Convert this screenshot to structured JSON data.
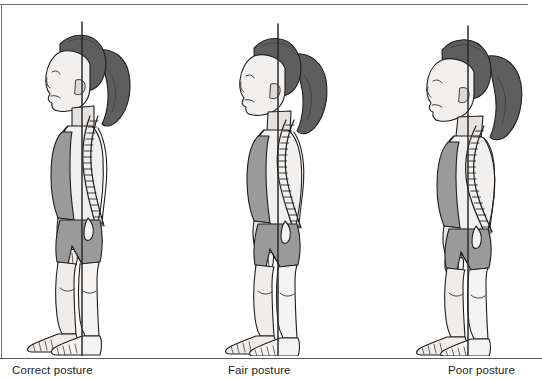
{
  "illustration": {
    "title": "Posture comparison chart",
    "subject": "young girl standing in right-side profile view",
    "view": "lateral (sagittal) profile, facing left",
    "count": 3,
    "shared_features": [
      "vertical plumb line reference",
      "visible vertebral column overlay",
      "ponytail hairstyle",
      "sleeveless top and shorts",
      "bare feet"
    ]
  },
  "palette": {
    "background": "#ffffff",
    "outline": "#1e1e1e",
    "skin_light": "#f2f0ee",
    "skin_shadow": "#d8d5d2",
    "garment_gray": "#9a9a9a",
    "garment_gray_dark": "#868686",
    "hair_dark": "#5e5e5e",
    "hair_shadow": "#4a4a4a",
    "spine_fill": "#fbfbfb",
    "plumb_line": "#2a2a2a",
    "rule_gray": "#6e6e6e",
    "caption_text": "#1b1b1b"
  },
  "captions": [
    {
      "label": "Correct posture"
    },
    {
      "label": "Fair posture"
    },
    {
      "label": "Poor posture"
    }
  ],
  "figures": [
    {
      "id": "correct-posture",
      "label": "Correct posture",
      "head_position": "aligned — ear over the plumb line",
      "spine_description": "gentle, balanced cervical, thoracic and lumbar curves",
      "plumb_line_note": "passes through ear, shoulder, hip and just ahead of the ankle",
      "severity": 0
    },
    {
      "id": "fair-posture",
      "label": "Fair posture",
      "head_position": "slightly forward of the plumb line",
      "spine_description": "moderately increased thoracic rounding and lumbar curve",
      "plumb_line_note": "head and shoulders drift ahead of the line",
      "severity": 1
    },
    {
      "id": "poor-posture",
      "label": "Poor posture",
      "head_position": "markedly forward of the plumb line",
      "spine_description": "pronounced rounded upper back with exaggerated curves",
      "plumb_line_note": "head, neck and chest fall well ahead of the line",
      "severity": 2
    }
  ]
}
